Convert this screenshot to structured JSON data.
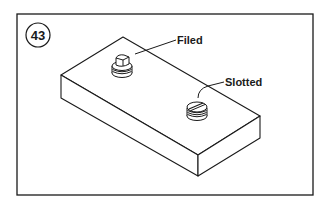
{
  "figure": {
    "number": "43",
    "labels": {
      "filed": "Filed",
      "slotted": "Slotted"
    },
    "colors": {
      "stroke": "#1a1a1a",
      "background": "#ffffff"
    }
  }
}
